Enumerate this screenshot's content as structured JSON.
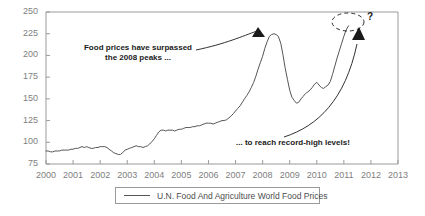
{
  "chart_data": {
    "type": "line",
    "title": "",
    "xlabel": "",
    "ylabel": "",
    "xlim": [
      2000,
      2013
    ],
    "ylim": [
      75,
      250
    ],
    "grid": false,
    "legend_position": "bottom",
    "series": [
      {
        "name": "U.N. Food And Agriculture World Food Prices",
        "color": "#555555",
        "x": [
          2000.0,
          2000.08,
          2000.17,
          2000.25,
          2000.33,
          2000.42,
          2000.5,
          2000.58,
          2000.67,
          2000.75,
          2000.83,
          2000.92,
          2001.0,
          2001.08,
          2001.17,
          2001.25,
          2001.33,
          2001.42,
          2001.5,
          2001.58,
          2001.67,
          2001.75,
          2001.83,
          2001.92,
          2002.0,
          2002.08,
          2002.17,
          2002.25,
          2002.33,
          2002.42,
          2002.5,
          2002.58,
          2002.67,
          2002.75,
          2002.83,
          2002.92,
          2003.0,
          2003.08,
          2003.17,
          2003.25,
          2003.33,
          2003.42,
          2003.5,
          2003.58,
          2003.67,
          2003.75,
          2003.83,
          2003.92,
          2004.0,
          2004.08,
          2004.17,
          2004.25,
          2004.33,
          2004.42,
          2004.5,
          2004.58,
          2004.67,
          2004.75,
          2004.83,
          2004.92,
          2005.0,
          2005.08,
          2005.17,
          2005.25,
          2005.33,
          2005.42,
          2005.5,
          2005.58,
          2005.67,
          2005.75,
          2005.83,
          2005.92,
          2006.0,
          2006.08,
          2006.17,
          2006.25,
          2006.33,
          2006.42,
          2006.5,
          2006.58,
          2006.67,
          2006.75,
          2006.83,
          2006.92,
          2007.0,
          2007.08,
          2007.17,
          2007.25,
          2007.33,
          2007.42,
          2007.5,
          2007.58,
          2007.67,
          2007.75,
          2007.83,
          2007.92,
          2008.0,
          2008.08,
          2008.17,
          2008.25,
          2008.33,
          2008.42,
          2008.5,
          2008.58,
          2008.67,
          2008.75,
          2008.83,
          2008.92,
          2009.0,
          2009.08,
          2009.17,
          2009.25,
          2009.33,
          2009.42,
          2009.5,
          2009.58,
          2009.67,
          2009.75,
          2009.83,
          2009.92,
          2010.0,
          2010.08,
          2010.17,
          2010.25,
          2010.33,
          2010.42,
          2010.5,
          2010.58,
          2010.67,
          2010.75,
          2010.83,
          2010.92,
          2011.0,
          2011.08,
          2011.17
        ],
        "values": [
          90,
          90,
          89,
          89,
          90,
          90,
          90,
          91,
          91,
          91,
          91,
          92,
          92,
          93,
          93,
          94,
          95,
          94,
          95,
          94,
          93,
          93,
          94,
          94,
          95,
          95,
          95,
          94,
          92,
          90,
          88,
          87,
          86,
          86,
          88,
          91,
          92,
          93,
          94,
          95,
          96,
          95,
          95,
          94,
          95,
          96,
          98,
          101,
          104,
          108,
          112,
          114,
          114,
          113,
          114,
          114,
          114,
          113,
          114,
          115,
          115,
          116,
          117,
          117,
          117,
          118,
          118,
          119,
          119,
          120,
          121,
          122,
          122,
          122,
          121,
          122,
          123,
          124,
          125,
          125,
          126,
          128,
          130,
          133,
          136,
          139,
          142,
          146,
          150,
          154,
          158,
          163,
          169,
          176,
          184,
          192,
          199,
          208,
          216,
          222,
          224,
          225,
          224,
          222,
          214,
          201,
          186,
          172,
          160,
          152,
          148,
          145,
          146,
          150,
          153,
          156,
          158,
          160,
          163,
          167,
          169,
          166,
          163,
          162,
          164,
          166,
          170,
          178,
          188,
          197,
          205,
          214,
          222,
          229,
          234
        ]
      }
    ],
    "yticks": [
      75,
      100,
      125,
      150,
      175,
      200,
      225,
      250
    ],
    "xticks": [
      2000,
      2001,
      2002,
      2003,
      2004,
      2005,
      2006,
      2007,
      2008,
      2009,
      2010,
      2011,
      2012,
      2013
    ],
    "annotations": [
      {
        "id": "annotation-1",
        "line1": "Food prices have surpassed",
        "line2": "the 2008 peaks ...",
        "points_to": {
          "x": 2008.0,
          "y": 228
        }
      },
      {
        "id": "annotation-2",
        "line1": "... to reach record-high levels!",
        "points_to": {
          "x": 2011.3,
          "y": 225
        }
      }
    ],
    "markers": [
      {
        "name": "uncertainty-ellipse",
        "style": "dashed-ellipse",
        "center_x": 2011.0,
        "center_y": 243
      },
      {
        "name": "question-mark",
        "label": "?"
      }
    ]
  },
  "legend": {
    "label": "U.N. Food And Agriculture World Food Prices",
    "color": "#555555"
  },
  "axis_colors": {
    "axis": "#9a9a9a",
    "tick_text": "#808080",
    "series": "#555555",
    "annotation_text": "#1a1a1a"
  }
}
